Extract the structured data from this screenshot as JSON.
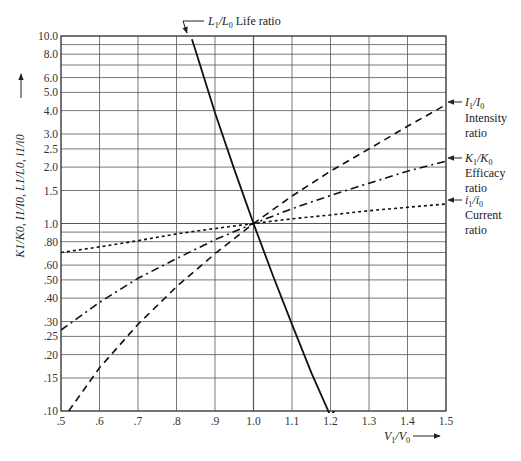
{
  "chart_data": {
    "type": "line",
    "title": "",
    "xlabel": "V1/V0",
    "ylabel": "K1/K0, I1/I0, L1/L0, i1/i0",
    "xscale": "linear",
    "yscale": "log",
    "xlim": [
      0.5,
      1.5
    ],
    "ylim": [
      0.1,
      10.0
    ],
    "grid": true,
    "x_ticks": [
      ".5",
      ".6",
      ".7",
      ".8",
      ".9",
      "1.0",
      "1.1",
      "1.2",
      "1.3",
      "1.4",
      "1.5"
    ],
    "x_tick_values": [
      0.5,
      0.6,
      0.7,
      0.8,
      0.9,
      1.0,
      1.1,
      1.2,
      1.3,
      1.4,
      1.5
    ],
    "y_ticks": [
      "10.0",
      "8.0",
      "6.0",
      "5.0",
      "4.0",
      "3.0",
      "2.5",
      "2.0",
      "1.5",
      "1.0",
      ".80",
      ".60",
      ".50",
      ".40",
      ".30",
      ".25",
      ".20",
      ".15",
      ".10"
    ],
    "y_tick_values": [
      10.0,
      8.0,
      6.0,
      5.0,
      4.0,
      3.0,
      2.5,
      2.0,
      1.5,
      1.0,
      0.8,
      0.6,
      0.5,
      0.4,
      0.3,
      0.25,
      0.2,
      0.15,
      0.1
    ],
    "y_gridlines": [
      10,
      9,
      8,
      7,
      6,
      5,
      4,
      3,
      2.5,
      2,
      1.5,
      1,
      0.9,
      0.8,
      0.7,
      0.6,
      0.5,
      0.4,
      0.3,
      0.25,
      0.2,
      0.15,
      0.1
    ],
    "series": [
      {
        "name": "L1/L0 Life ratio",
        "style": "solid",
        "x": [
          0.84,
          0.85,
          0.9,
          0.95,
          1.0,
          1.05,
          1.1,
          1.15,
          1.2,
          1.21
        ],
        "values": [
          9.6,
          8.3,
          3.9,
          1.95,
          1.0,
          0.53,
          0.29,
          0.16,
          0.094,
          0.1
        ]
      },
      {
        "name": "I1/I0 Intensity ratio",
        "style": "dashed",
        "x": [
          0.52,
          0.6,
          0.7,
          0.8,
          0.9,
          1.0,
          1.1,
          1.2,
          1.3,
          1.4,
          1.5
        ],
        "values": [
          0.1,
          0.17,
          0.29,
          0.46,
          0.69,
          1.0,
          1.4,
          1.9,
          2.5,
          3.3,
          4.3
        ]
      },
      {
        "name": "K1/K0 Efficacy ratio",
        "style": "dash-dot",
        "x": [
          0.5,
          0.6,
          0.7,
          0.8,
          0.9,
          1.0,
          1.1,
          1.2,
          1.3,
          1.4,
          1.5
        ],
        "values": [
          0.27,
          0.38,
          0.51,
          0.65,
          0.82,
          1.0,
          1.2,
          1.41,
          1.64,
          1.9,
          2.15
        ]
      },
      {
        "name": "i1/i0 Current ratio",
        "style": "dotted",
        "x": [
          0.5,
          0.6,
          0.7,
          0.8,
          0.9,
          1.0,
          1.1,
          1.2,
          1.3,
          1.4,
          1.5
        ],
        "values": [
          0.7,
          0.75,
          0.81,
          0.88,
          0.94,
          1.0,
          1.06,
          1.11,
          1.17,
          1.22,
          1.27
        ]
      }
    ],
    "annotations": [
      {
        "text": "L1/L0 Life ratio",
        "position": "top, pointing to life curve at top edge"
      },
      {
        "text": "I1/I0 Intensity ratio",
        "position": "right, pointing to intensity curve end"
      },
      {
        "text": "K1/K0 Efficacy ratio",
        "position": "right, pointing to efficacy curve end"
      },
      {
        "text": "i1/i0 Current ratio",
        "position": "right, pointing to current curve end"
      }
    ]
  },
  "labels": {
    "life_sym": "L",
    "life_sub1": "1",
    "life_slash": "/",
    "life_sub0": "0",
    "life_text": "Life ratio",
    "intensity_sym": "I",
    "intensity_text": "Intensity",
    "intensity_text2": "ratio",
    "efficacy_sym": "K",
    "efficacy_text": "Efficacy",
    "efficacy_text2": "ratio",
    "current_sym": "i",
    "current_text": "Current",
    "current_text2": "ratio",
    "x_axis_sym": "V",
    "y_axis_label": "K1/K0, I1/I0, L1/L0, i1/i0"
  }
}
